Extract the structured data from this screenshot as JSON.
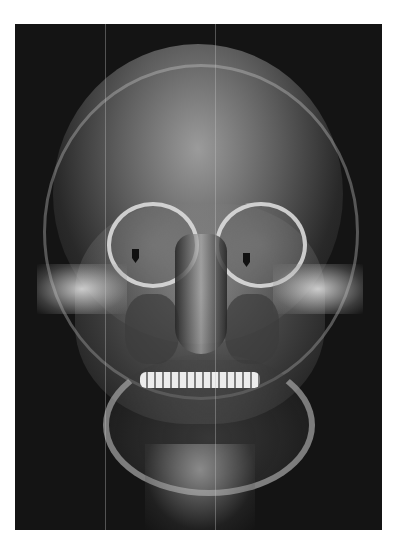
{
  "image": {
    "type": "radiograph",
    "view": "posteroanterior skull",
    "background_color": "#ffffff",
    "film_color": "#141414",
    "markers": [
      {
        "name": "arrow-left-orbit",
        "x": 136,
        "y": 253,
        "color": "#111111",
        "direction": "down"
      },
      {
        "name": "arrow-right-orbit",
        "x": 247,
        "y": 257,
        "color": "#111111",
        "direction": "down"
      }
    ]
  }
}
